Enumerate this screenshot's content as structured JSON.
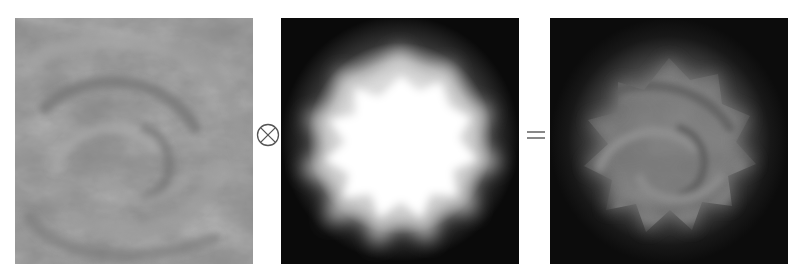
{
  "figure": {
    "panels": [
      {
        "id": "texture",
        "label": "swirling grayscale texture",
        "tone": "medium gray",
        "base_color": "#8a8a8a"
      },
      {
        "id": "mask",
        "label": "soft radial mask",
        "tone": "white blob on black",
        "base_color": "#0a0a0a",
        "highlight_color": "#ffffff"
      },
      {
        "id": "result",
        "label": "masked texture result",
        "tone": "gray swirl fading to black",
        "base_color": "#0c0c0c"
      }
    ],
    "operators": {
      "multiply": "⊗",
      "equals": "="
    },
    "colors": {
      "background": "#ffffff",
      "operator": "#555555"
    }
  }
}
